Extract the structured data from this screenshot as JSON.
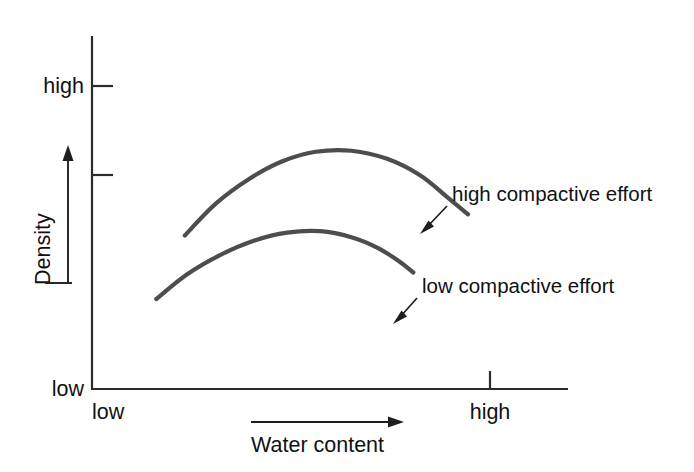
{
  "chart_data": {
    "type": "line",
    "title": "",
    "subtitle": "",
    "xlabel": "Water content",
    "ylabel": "Density",
    "grid": false,
    "legend_position": "inline-annotations",
    "x_tick_labels": [
      "low",
      "high"
    ],
    "y_tick_labels": [
      "low",
      "high"
    ],
    "xlim": [
      "low",
      "high"
    ],
    "ylim": [
      "low",
      "high"
    ],
    "annotations": [
      {
        "text": "high compactive effort",
        "points_to_series": "high compactive effort"
      },
      {
        "text": "low compactive effort",
        "points_to_series": "low compactive effort"
      }
    ],
    "series": [
      {
        "name": "high compactive effort",
        "comment": "upper inverted-parabola compaction curve",
        "x": [
          0.195,
          0.26,
          0.33,
          0.4,
          0.47,
          0.545,
          0.62,
          0.69,
          0.745,
          0.79
        ],
        "y": [
          0.435,
          0.525,
          0.595,
          0.645,
          0.672,
          0.675,
          0.652,
          0.605,
          0.545,
          0.495
        ]
      },
      {
        "name": "low compactive effort",
        "comment": "lower inverted-parabola compaction curve",
        "x": [
          0.135,
          0.2,
          0.27,
          0.34,
          0.41,
          0.48,
          0.545,
          0.6,
          0.645,
          0.675
        ],
        "y": [
          0.255,
          0.325,
          0.38,
          0.42,
          0.443,
          0.447,
          0.43,
          0.4,
          0.362,
          0.33
        ]
      }
    ]
  },
  "axes": {
    "y": {
      "title": "Density",
      "low_label": "low",
      "high_label": "high",
      "tick_count": 2
    },
    "x": {
      "title": "Water content",
      "low_label": "low",
      "high_label": "high",
      "tick_count": 1
    }
  },
  "icons": {
    "y_direction_arrow": "arrow-up-icon",
    "x_direction_arrow": "arrow-right-icon",
    "callout_high": "arrow-down-left-icon",
    "callout_low": "arrow-down-left-icon"
  },
  "colors": {
    "curve": "#4d4d4d",
    "axis": "#2b2b2b",
    "text": "#111111",
    "background": "#ffffff"
  }
}
